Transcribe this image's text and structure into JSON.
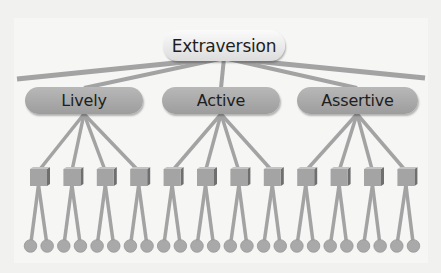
{
  "diagram": {
    "root": {
      "label": "Extraversion"
    },
    "facets": [
      {
        "label": "Lively",
        "left": 25,
        "width": 118,
        "center": 84
      },
      {
        "label": "Active",
        "left": 162,
        "width": 118,
        "center": 221
      },
      {
        "label": "Assertive",
        "left": 297,
        "width": 121,
        "center": 357
      }
    ],
    "habits_per_facet": 4,
    "behaviors_per_habit": 2,
    "colors": {
      "background": "#f1f1f0",
      "connector": "#a3a3a3",
      "node_fill": "#a8a8a8",
      "root_fill": "#efefef"
    }
  }
}
